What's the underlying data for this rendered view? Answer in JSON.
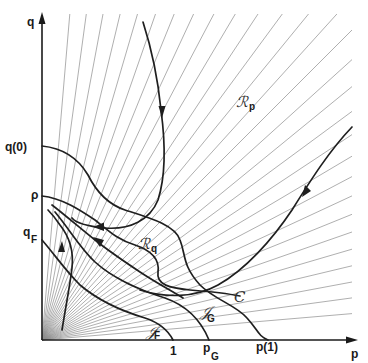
{
  "diagram": {
    "type": "phase-plane",
    "axes": {
      "x_label": "p",
      "y_label": "q",
      "origin_px": [
        42,
        340
      ],
      "x_end_px": 358,
      "y_end_px": 14
    },
    "colors": {
      "axis": "#1a1a1a",
      "ray": "#8c8c8c",
      "curve": "#1f1f1f",
      "background": "#ffffff"
    },
    "y_axis_ticks": [
      {
        "id": "q0",
        "label": "q(0)",
        "y": 152
      },
      {
        "id": "rho",
        "label": "ρ",
        "y": 196
      },
      {
        "id": "qF",
        "label": "q",
        "sub": "F",
        "y": 239
      }
    ],
    "x_axis_ticks": [
      {
        "id": "one",
        "label": "1",
        "x": 173
      },
      {
        "id": "pG",
        "label": "p",
        "sub": "G",
        "x": 209
      },
      {
        "id": "p1",
        "label": "p(1)",
        "x": 266
      }
    ],
    "region_labels": [
      {
        "id": "Rp",
        "main": "ℛ",
        "sub": "p",
        "x": 240,
        "y": 103
      },
      {
        "id": "Rq",
        "main": "ℛ",
        "sub": "q",
        "x": 142,
        "y": 245
      },
      {
        "id": "C",
        "main": "C",
        "sub": "",
        "x": 236,
        "y": 298
      },
      {
        "id": "JG",
        "main": "𝒥",
        "sub": "G",
        "x": 200,
        "y": 315
      },
      {
        "id": "JF",
        "main": "𝒥",
        "sub": "F",
        "x": 148,
        "y": 335
      }
    ],
    "ray_count": 30,
    "curves": [
      {
        "id": "top-trajectory",
        "description": "descends from top, loops down-left to q(0) region"
      },
      {
        "id": "right-trajectory",
        "description": "enters from right edge, sweeps down-left to near Rq"
      },
      {
        "id": "C-curve",
        "description": "from ρ on q-axis down to p(1) on p-axis"
      },
      {
        "id": "JG-curve",
        "description": "isocline through p_G"
      },
      {
        "id": "JF-curve",
        "description": "isocline through q_F to 1"
      },
      {
        "id": "q0-curve",
        "description": "from q(0) bending down"
      },
      {
        "id": "inner-trajectory-1",
        "description": "with upward arrow near origin"
      },
      {
        "id": "inner-trajectory-2",
        "description": "middle trajectory with arrow"
      }
    ]
  }
}
